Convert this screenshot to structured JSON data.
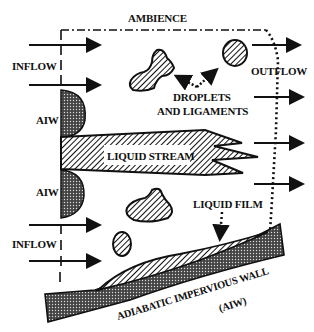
{
  "diagram": {
    "labels": {
      "ambience": "AMBIENCE",
      "inflow_top": "INFLOW",
      "inflow_bottom": "INFLOW",
      "outflow": "OUTFLOW",
      "aiw_top": "AIW",
      "aiw_bottom": "AIW",
      "droplets_line1": "DROPLETS",
      "droplets_line2": "AND LIGAMENTS",
      "liquid_stream": "LIQUID STREAM",
      "liquid_film": "LIQUID FILM",
      "wall_line1": "ADIABATIC IMPERVIOUS WALL",
      "wall_line2": "(AIW)"
    },
    "colors": {
      "ink": "#111111",
      "background": "#ffffff"
    },
    "inflow_arrows": 4,
    "outflow_arrows": 4
  }
}
